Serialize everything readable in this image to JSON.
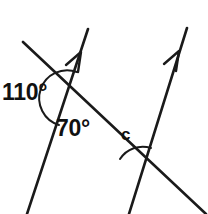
{
  "figure": {
    "type": "geometry-diagram",
    "background_color": "#ffffff",
    "stroke_color": "#1a1a1a",
    "labels": {
      "angle_110": "110°",
      "angle_70": "70°",
      "angle_c": "c"
    },
    "elements": {
      "parallel_line_1_name": "parallel-line-left",
      "parallel_line_2_name": "parallel-line-right",
      "transversal_name": "transversal-line",
      "arrow_marker_1_name": "parallel-marker-arrow-left",
      "arrow_marker_2_name": "parallel-marker-arrow-right",
      "arc_110_name": "angle-arc-110",
      "arc_c_name": "angle-arc-c"
    },
    "geometry": {
      "parallel_line_1": {
        "x1": 88,
        "y1": 29,
        "x2": 27,
        "y2": 214
      },
      "parallel_line_2": {
        "x1": 187,
        "y1": 28,
        "x2": 129,
        "y2": 214
      },
      "transversal": {
        "x1": 23,
        "y1": 42,
        "x2": 206,
        "y2": 214
      },
      "intersection_1": {
        "x": 67,
        "y": 99
      },
      "intersection_2": {
        "x": 142,
        "y": 174
      },
      "arrow_1_tip": {
        "x": 80,
        "y": 53
      },
      "arrow_2_tip": {
        "x": 178,
        "y": 52
      }
    }
  }
}
